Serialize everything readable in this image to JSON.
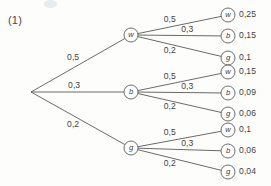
{
  "figure": {
    "number_label": "(1)",
    "type": "probability-tree-diagram",
    "stroke_color": "#595959",
    "text_color": "#3f3f3f",
    "background_color": "#fdfdfc"
  },
  "chart_data": {
    "type": "diagram",
    "title": "(1)",
    "diagram_kind": "probability tree",
    "decimal_separator": ",",
    "root": {
      "label": "",
      "x": 31,
      "y": 92
    },
    "level1": [
      {
        "id": "n1-w",
        "letter": "w",
        "probability": "0,5",
        "x": 131,
        "y": 35
      },
      {
        "id": "n1-b",
        "letter": "b",
        "probability": "0,3",
        "x": 131,
        "y": 92
      },
      {
        "id": "n1-g",
        "letter": "g",
        "probability": "0,2",
        "x": 131,
        "y": 148
      }
    ],
    "level2": [
      {
        "parent": "n1-w",
        "letter": "w",
        "probability": "0,5",
        "outcome": "0,25",
        "x": 228,
        "y": 15
      },
      {
        "parent": "n1-w",
        "letter": "b",
        "probability": "0,3",
        "outcome": "0,15",
        "x": 228,
        "y": 36
      },
      {
        "parent": "n1-w",
        "letter": "g",
        "probability": "0,2",
        "outcome": "0,1",
        "x": 228,
        "y": 58
      },
      {
        "parent": "n1-b",
        "letter": "w",
        "probability": "0,5",
        "outcome": "0,15",
        "x": 228,
        "y": 72
      },
      {
        "parent": "n1-b",
        "letter": "b",
        "probability": "0,3",
        "outcome": "0,09",
        "x": 228,
        "y": 93
      },
      {
        "parent": "n1-b",
        "letter": "g",
        "probability": "0,2",
        "outcome": "0,06",
        "x": 228,
        "y": 114
      },
      {
        "parent": "n1-g",
        "letter": "w",
        "probability": "0,5",
        "outcome": "0,1",
        "x": 228,
        "y": 130
      },
      {
        "parent": "n1-g",
        "letter": "b",
        "probability": "0,3",
        "outcome": "0,06",
        "x": 228,
        "y": 151
      },
      {
        "parent": "n1-g",
        "letter": "g",
        "probability": "0,2",
        "outcome": "0,04",
        "x": 228,
        "y": 172
      }
    ],
    "edge_labels_level1": [
      "0,5",
      "0,3",
      "0,2"
    ],
    "edge_labels_level2": [
      "0,5",
      "0,3",
      "0,2"
    ],
    "leaf_values": [
      "0,25",
      "0,15",
      "0,1",
      "0,15",
      "0,09",
      "0,06",
      "0,1",
      "0,06",
      "0,04"
    ],
    "legend": []
  }
}
